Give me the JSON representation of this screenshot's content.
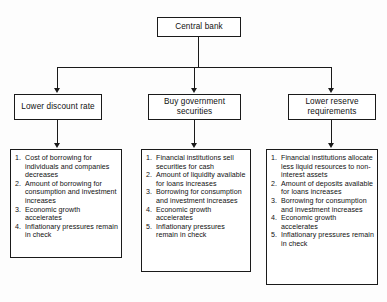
{
  "diagram": {
    "root": {
      "label": "Central bank"
    },
    "branches": [
      {
        "id": "lower-discount-rate",
        "tool": "Lower discount rate",
        "effects": [
          "Cost of borrowing for individuals and companies decreases",
          "Amount of borrowing for consumption and investment increases",
          "Economic growth accelerates",
          "Inflationary pressures remain in check"
        ]
      },
      {
        "id": "buy-government-securities",
        "tool": "Buy government securities",
        "effects": [
          "Financial institutions sell securities for cash",
          "Amount of liquidity available for loans increases",
          "Borrowing for consumption and investment increases",
          "Economic growth accelerates",
          "Inflationary pressures remain in check"
        ]
      },
      {
        "id": "lower-reserve-requirements",
        "tool": "Lower reserve requirements",
        "effects": [
          "Financial institutions allocate less liquid resources to non-interest assets",
          "Amount of deposits available for loans increases",
          "Borrowing for consumption and investment increases",
          "Economic growth accelerates",
          "Inflationary pressures remain in check"
        ]
      }
    ],
    "colors": {
      "stroke": "#1a1a1a",
      "text": "#111111",
      "background": "#fdfdfd"
    }
  }
}
